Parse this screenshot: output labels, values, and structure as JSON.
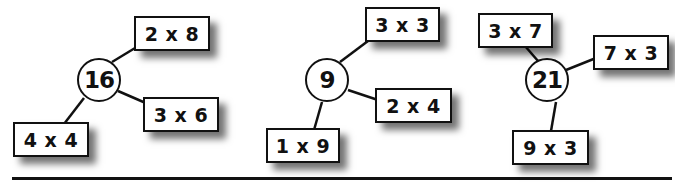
{
  "diagrams": [
    {
      "number": "16",
      "factor_pairs": [
        "2 x 8",
        "3 x 6",
        "4 x 4"
      ]
    },
    {
      "number": "9",
      "factor_pairs": [
        "3 x 3",
        "2 x 4",
        "1 x 9"
      ]
    },
    {
      "number": "21",
      "factor_pairs": [
        "3 x 7",
        "7 x 3",
        "9 x 3"
      ]
    }
  ],
  "colors": {
    "stroke": "#111111",
    "background": "#ffffff"
  }
}
